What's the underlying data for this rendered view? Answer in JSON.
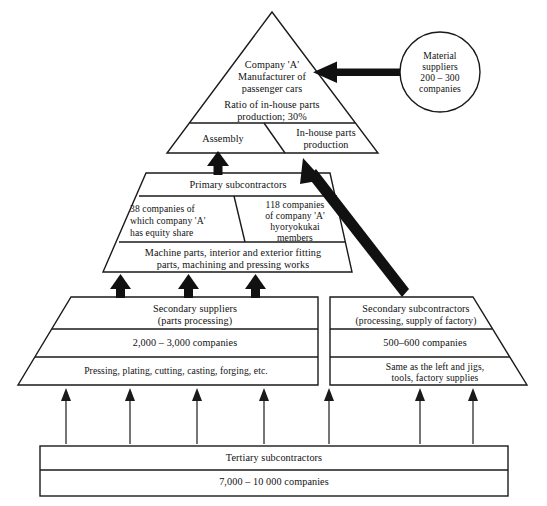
{
  "diagram": {
    "apex": {
      "company_line1": "Company 'A'",
      "company_line2": "Manufacturer of",
      "company_line3": "passenger cars",
      "ratio_line1": "Ratio of in-house parts",
      "ratio_line2": "production; 30%",
      "assembly_label": "Assembly",
      "inhouse_line1": "In-house parts",
      "inhouse_line2": "production"
    },
    "material_suppliers": {
      "line1": "Material",
      "line2": "suppliers",
      "line3": "200 – 300",
      "line4": "companies"
    },
    "primary": {
      "heading": "Primary subcontractors",
      "left_line1": "38 companies of",
      "left_line2": "which company 'A'",
      "left_line3": "has equity share",
      "right_line1": "118 companies",
      "right_line2": "of company 'A'",
      "right_line3": "hyoryokukai",
      "right_line4": "members",
      "works_line1": "Machine parts, interior and exterior fitting",
      "works_line2": "parts, machining and pressing works"
    },
    "secondary_suppliers": {
      "heading_line1": "Secondary suppliers",
      "heading_line2": "(parts processing)",
      "count": "2,000 – 3,000 companies",
      "detail": "Pressing, plating, cutting, casting, forging, etc."
    },
    "secondary_subcontractors": {
      "heading_line1": "Secondary subcontractors",
      "heading_line2": "(processing, supply of factory)",
      "count": "500–600 companies",
      "detail_line1": "Same as the left and jigs,",
      "detail_line2": "tools, factory supplies"
    },
    "tertiary": {
      "heading": "Tertiary subcontractors",
      "count": "7,000 – 10 000 companies"
    },
    "colors": {
      "stroke": "#1a1a1a",
      "fill": "#ffffff",
      "arrow": "#111111"
    }
  }
}
